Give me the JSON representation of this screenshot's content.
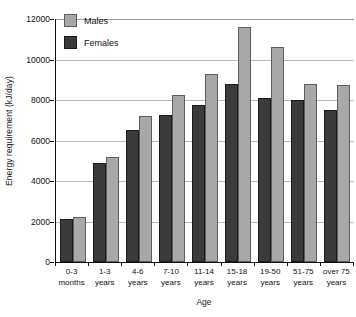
{
  "chart_data": {
    "type": "bar",
    "title": "",
    "xlabel": "Age",
    "ylabel": "Energy requirement (kJ/day)",
    "categories": [
      "0-3\nmonths",
      "1-3\nyears",
      "4-6\nyears",
      "7-10\nyears",
      "11-14\nyears",
      "15-18\nyears",
      "19-50\nyears",
      "51-75\nyears",
      "over 75\nyears"
    ],
    "series": [
      {
        "name": "Females",
        "color": "#3b3b3b",
        "values": [
          2100,
          4900,
          6500,
          7250,
          7750,
          8800,
          8100,
          8000,
          7500
        ]
      },
      {
        "name": "Males",
        "color": "#a8a8a8",
        "values": [
          2200,
          5200,
          7200,
          8250,
          9300,
          11600,
          10600,
          8800,
          8750
        ]
      }
    ],
    "series_order_in_group": [
      "Females",
      "Males"
    ],
    "ylim": [
      0,
      12000
    ],
    "ytick_values": [
      0,
      2000,
      4000,
      6000,
      8000,
      10000,
      12000
    ],
    "ytick_labels": [
      "0",
      "2000",
      "4000",
      "6000",
      "8000",
      "10000",
      "12000"
    ],
    "grid": true,
    "grid_axis": "y",
    "legend_position": "top-left",
    "legend_entries": [
      "Males",
      "Females"
    ]
  }
}
